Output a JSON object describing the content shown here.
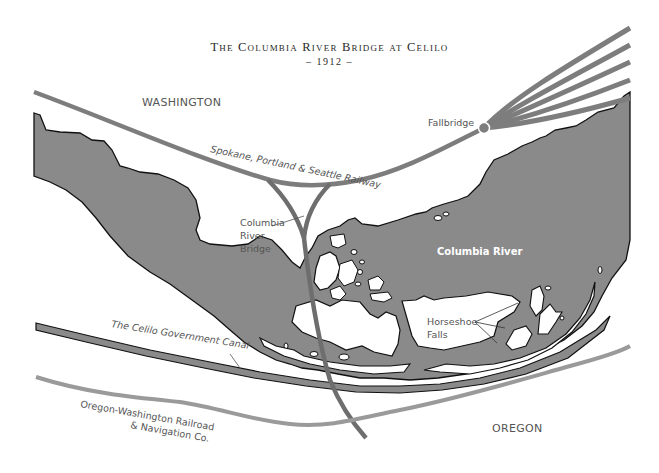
{
  "map": {
    "title": "The Columbia River Bridge at Celilo",
    "subtitle": "– 1912 –",
    "labels": {
      "washington": "WASHINGTON",
      "oregon": "OREGON",
      "fallbridge": "Fallbridge",
      "sps_railway": "Spokane, Portland & Seattle Railway",
      "bridge_line1": "Columbia",
      "bridge_line2": "River",
      "bridge_line3": "Bridge",
      "river": "Columbia River",
      "falls_line1": "Horseshoe",
      "falls_line2": "Falls",
      "canal": "The Celilo Government Canal",
      "owr_line1": "Oregon-Washington Railroad",
      "owr_line2": "& Navigation Co."
    },
    "colors": {
      "water": "#8a8a8a",
      "railway_dark": "#6e6e6e",
      "railway_light": "#9a9a9a",
      "outline": "#111111",
      "background": "#ffffff"
    }
  }
}
